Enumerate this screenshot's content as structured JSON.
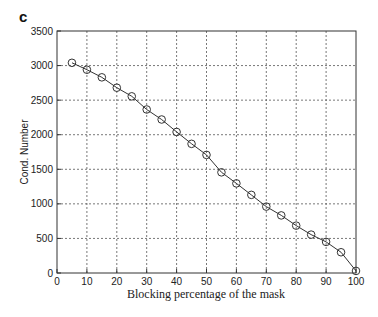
{
  "panel_label": "c",
  "chart_data": {
    "type": "line",
    "title": "",
    "xlabel": "Blocking percentage of the mask",
    "ylabel": "Cond. Number",
    "xlim": [
      0,
      100
    ],
    "ylim": [
      0,
      3500
    ],
    "xticks": [
      0,
      10,
      20,
      30,
      40,
      50,
      60,
      70,
      80,
      90,
      100
    ],
    "yticks": [
      0,
      500,
      1000,
      1500,
      2000,
      2500,
      3000,
      3500
    ],
    "grid": true,
    "legend": null,
    "marker": "circle",
    "series": [
      {
        "name": "Cond. Number",
        "x": [
          5,
          10,
          15,
          20,
          25,
          30,
          35,
          40,
          45,
          50,
          55,
          60,
          65,
          70,
          75,
          80,
          85,
          90,
          95,
          100
        ],
        "y": [
          3040,
          2940,
          2830,
          2680,
          2555,
          2365,
          2220,
          2040,
          1868,
          1708,
          1456,
          1296,
          1130,
          960,
          833,
          685,
          555,
          450,
          300,
          30
        ]
      }
    ]
  }
}
